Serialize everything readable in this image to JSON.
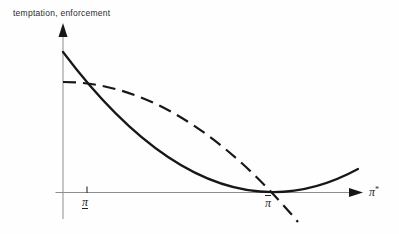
{
  "figure": {
    "y_axis_title": "temptation, enforcement",
    "x_axis_label": {
      "base": "π",
      "sup": "*"
    },
    "ticks": {
      "pi_lower": "π",
      "pi_upper": "π"
    }
  },
  "colors": {
    "curve": "#171717",
    "axis": "#8d8d8d",
    "tick": "#3a3a3a",
    "text": "#2b2b2b"
  },
  "chart_data": {
    "type": "line",
    "title": "",
    "xlabel": "π*",
    "ylabel": "temptation, enforcement",
    "legend_position": "none",
    "grid": false,
    "axes_px": {
      "origin": [
        63,
        192.5
      ],
      "x_axis_from": [
        55.5,
        192.5
      ],
      "x_axis_to": [
        349,
        192.5
      ],
      "x_arrow_tip": [
        363,
        192.5
      ],
      "y_axis_from": [
        63,
        219
      ],
      "y_axis_to": [
        63,
        37
      ],
      "y_arrow_tip": [
        63,
        23
      ]
    },
    "x_ticks": [
      {
        "name": "pi-lower-bound",
        "label": "π (underlined)",
        "x_px": 87,
        "has_axis_tick": true
      },
      {
        "name": "pi-upper-bound",
        "label": "π (overlined)",
        "x_px": 270,
        "has_axis_tick": false
      }
    ],
    "series": [
      {
        "name": "temptation",
        "line_style": "solid",
        "stroke_width": 2.2,
        "description": "Convex curve: starts high on the y-axis, decreases steeply, reaches a minimum touching the x-axis at the overlined π tick, then increases toward the right.",
        "bezier_px": {
          "start": [
            63,
            52
          ],
          "control": [
            211,
            249
          ],
          "end": [
            358,
            169
          ]
        },
        "points_px": [
          [
            63,
            52
          ],
          [
            100,
            97
          ],
          [
            150,
            144
          ],
          [
            200,
            175
          ],
          [
            240,
            187
          ],
          [
            272,
            191
          ],
          [
            312,
            186
          ],
          [
            358,
            169
          ]
        ]
      },
      {
        "name": "enforcement",
        "line_style": "dashed",
        "stroke_width": 2.2,
        "dash_pattern": "13 7",
        "description": "Concave dashed curve: starts on the y-axis below the solid curve's intercept, runs flat, then falls increasingly steeply, crossing the solid curve and the x-axis at the overlined π tick and continuing below the axis.",
        "bezier_px": {
          "start": [
            63,
            82
          ],
          "control": [
            180,
            82
          ],
          "end": [
            298,
            222
          ]
        },
        "points_px": [
          [
            63,
            82
          ],
          [
            95,
            84
          ],
          [
            130,
            94
          ],
          [
            170,
            111
          ],
          [
            215,
            138
          ],
          [
            250,
            168
          ],
          [
            272,
            192
          ],
          [
            298,
            222
          ]
        ]
      }
    ],
    "intersections_px": [
      {
        "note": "solid crosses dashed flat segment",
        "at": [
          86,
          82
        ]
      },
      {
        "note": "solid minimum, dashed crossing x-axis at overlined π",
        "at": [
          271,
          191.5
        ]
      }
    ]
  }
}
